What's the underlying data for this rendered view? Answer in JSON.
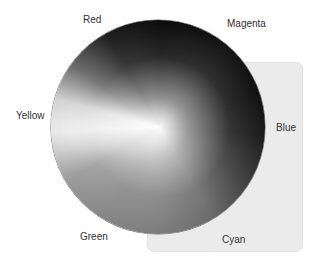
{
  "diagram": {
    "type": "color-wheel",
    "rendering": "grayscale",
    "labels": {
      "red": "Red",
      "magenta": "Magenta",
      "yellow": "Yellow",
      "blue": "Blue",
      "green": "Green",
      "cyan": "Cyan"
    }
  }
}
